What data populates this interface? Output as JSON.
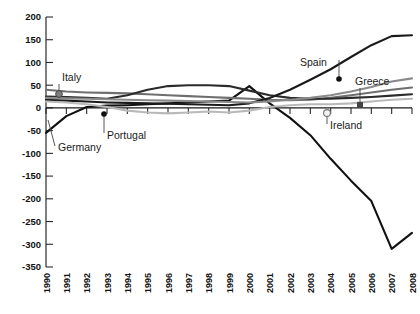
{
  "chart_data": {
    "type": "line",
    "title": "",
    "xlabel": "",
    "ylabel": "",
    "grid": false,
    "legend_position": "inline-callouts",
    "x": [
      1990,
      1991,
      1992,
      1993,
      1994,
      1995,
      1996,
      1997,
      1998,
      1999,
      2000,
      2001,
      2002,
      2003,
      2004,
      2005,
      2006,
      2007,
      2008
    ],
    "ylim": [
      -350,
      200
    ],
    "ytick_values": [
      200,
      150,
      100,
      50,
      0,
      -50,
      -100,
      -150,
      -200,
      -250,
      -300,
      -350
    ],
    "ytick_labels": [
      "200",
      "150",
      "100",
      "50",
      "0",
      "-50",
      "-100",
      "-150",
      "-200",
      "-250",
      "-300",
      "-350"
    ],
    "xtick_labels": [
      "1990",
      "1991",
      "1992",
      "1993",
      "1994",
      "1995",
      "1996",
      "1997",
      "1998",
      "1999",
      "2000",
      "2001",
      "2002",
      "2003",
      "2004",
      "2005",
      "2006",
      "2007",
      "2008"
    ],
    "series": [
      {
        "name": "Germany",
        "color": "#111111",
        "width": 2.2,
        "values": [
          -55,
          -18,
          2,
          5,
          6,
          8,
          10,
          12,
          14,
          16,
          48,
          10,
          -22,
          -60,
          -112,
          -160,
          -205,
          -310,
          -275
        ]
      },
      {
        "name": "Italy",
        "color": "#6f6f6f",
        "width": 2.0,
        "values": [
          40,
          36,
          34,
          33,
          32,
          30,
          28,
          26,
          24,
          22,
          20,
          18,
          17,
          18,
          22,
          28,
          34,
          40,
          45
        ]
      },
      {
        "name": "Portugal",
        "color": "#2b2b2b",
        "width": 2.0,
        "values": [
          25,
          24,
          22,
          20,
          28,
          40,
          48,
          50,
          50,
          48,
          38,
          28,
          22,
          20,
          20,
          22,
          24,
          27,
          30
        ]
      },
      {
        "name": "Spain",
        "color": "#1a1a1a",
        "width": 2.2,
        "values": [
          18,
          16,
          14,
          12,
          11,
          10,
          9,
          8,
          7,
          6,
          10,
          22,
          40,
          62,
          85,
          112,
          138,
          158,
          160
        ]
      },
      {
        "name": "Greece",
        "color": "#8a8a8a",
        "width": 2.0,
        "values": [
          22,
          21,
          20,
          19,
          18,
          17,
          16,
          15,
          14,
          13,
          12,
          14,
          18,
          22,
          28,
          36,
          46,
          58,
          65
        ]
      },
      {
        "name": "Ireland",
        "color": "#b9b9b9",
        "width": 1.9,
        "values": [
          14,
          12,
          8,
          2,
          -6,
          -10,
          -12,
          -10,
          -8,
          -10,
          -6,
          2,
          6,
          8,
          8,
          10,
          14,
          18,
          20
        ]
      }
    ],
    "annotations": [
      {
        "label": "Italy",
        "marker": "circle-gray",
        "marker_year": 1991,
        "marker_value": 40
      },
      {
        "label": "Germany",
        "marker": "none",
        "marker_year": 1991,
        "marker_value": -18
      },
      {
        "label": "Portugal",
        "marker": "dot-black",
        "marker_year": 1993,
        "marker_value": 20
      },
      {
        "label": "Spain",
        "marker": "dot-black",
        "marker_year": 2004,
        "marker_value": 85
      },
      {
        "label": "Greece",
        "marker": "square-dark",
        "marker_year": 2005,
        "marker_value": 36
      },
      {
        "label": "Ireland",
        "marker": "circle-light",
        "marker_year": 2004,
        "marker_value": 8
      }
    ]
  },
  "axis": {
    "y_title": "",
    "x_title": ""
  }
}
